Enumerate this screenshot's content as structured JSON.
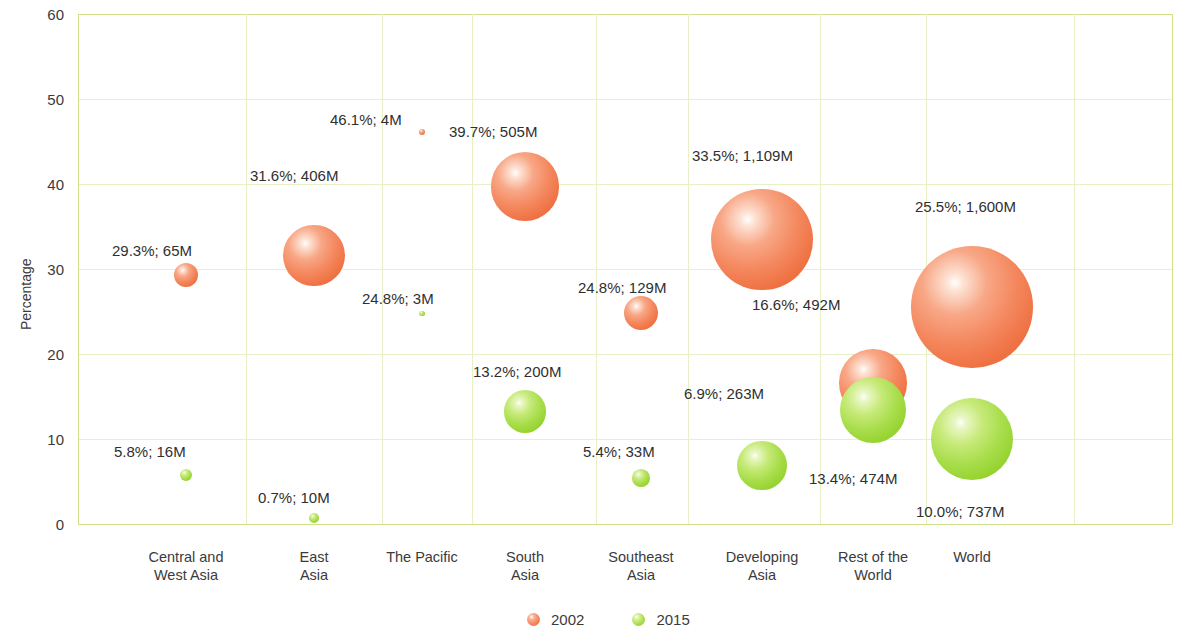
{
  "chart_data": {
    "type": "scatter",
    "title": "",
    "subtitle": "",
    "xlabel": "",
    "ylabel": "Percentage",
    "ylim": [
      0,
      60
    ],
    "y_ticks": [
      "0",
      "10",
      "20",
      "30",
      "40",
      "50",
      "60"
    ],
    "grid": true,
    "legend_position": "bottom",
    "bubble_size_units": "millions of people",
    "categories": [
      "Central and\nWest Asia",
      "East\nAsia",
      "The Pacific",
      "South\nAsia",
      "Southeast\nAsia",
      "Developing\nAsia",
      "Rest of the\nWorld",
      "World"
    ],
    "series": [
      {
        "name": "2002",
        "color": "#ef7243",
        "values": [
          29.3,
          31.6,
          46.1,
          39.7,
          24.8,
          33.5,
          16.6,
          25.5
        ],
        "sizes": [
          65,
          406,
          4,
          505,
          129,
          1109,
          492,
          1600
        ],
        "labels": [
          "29.3%; 65M",
          "31.6%; 406M",
          "46.1%; 4M",
          "39.7%; 505M",
          "24.8%; 129M",
          "33.5%; 1,109M",
          "16.6%; 492M",
          "25.5%; 1,600M"
        ]
      },
      {
        "name": "2015",
        "color": "#97d431",
        "values": [
          5.8,
          0.7,
          24.8,
          13.2,
          5.4,
          6.9,
          13.4,
          10.0
        ],
        "sizes": [
          16,
          10,
          3,
          200,
          33,
          263,
          474,
          737
        ],
        "labels": [
          "5.8%; 16M",
          "0.7%; 10M",
          "24.8%; 3M",
          "13.2%; 200M",
          "5.4%; 33M",
          "6.9%; 263M",
          "13.4%; 474M",
          "10.0%; 737M"
        ]
      }
    ]
  },
  "legend": {
    "items": [
      {
        "label": "2002",
        "swatch": "bubble-2002-swatch"
      },
      {
        "label": "2015",
        "swatch": "bubble-2015-swatch"
      }
    ]
  },
  "layout": {
    "plot": {
      "left": 78,
      "top": 14,
      "width": 1094,
      "height": 510
    },
    "y_axis_title_pos": {
      "left": 18,
      "top": 330
    },
    "legend_pos": {
      "left": 527,
      "top": 612
    },
    "x_label_top": 548,
    "category_centers": [
      186,
      314,
      422,
      525,
      641,
      762,
      873,
      972
    ],
    "grid_v_x": [
      78,
      246,
      382,
      472,
      596,
      688,
      820,
      926,
      1074,
      1172
    ],
    "bubble_scale": 1.52,
    "labels_2002": [
      {
        "x": 112,
        "y": 243,
        "anchor": "start"
      },
      {
        "x": 250,
        "y": 168,
        "anchor": "start"
      },
      {
        "x": 330,
        "y": 112,
        "anchor": "start"
      },
      {
        "x": 449,
        "y": 124,
        "anchor": "start"
      },
      {
        "x": 578,
        "y": 280,
        "anchor": "start"
      },
      {
        "x": 692,
        "y": 148,
        "anchor": "start"
      },
      {
        "x": 752,
        "y": 297,
        "anchor": "start"
      },
      {
        "x": 915,
        "y": 199,
        "anchor": "start"
      }
    ],
    "labels_2015": [
      {
        "x": 114,
        "y": 444,
        "anchor": "start"
      },
      {
        "x": 258,
        "y": 490,
        "anchor": "start"
      },
      {
        "x": 362,
        "y": 291,
        "anchor": "start"
      },
      {
        "x": 473,
        "y": 364,
        "anchor": "start"
      },
      {
        "x": 583,
        "y": 444,
        "anchor": "start"
      },
      {
        "x": 684,
        "y": 386,
        "anchor": "start"
      },
      {
        "x": 809,
        "y": 471,
        "anchor": "start"
      },
      {
        "x": 916,
        "y": 504,
        "anchor": "start"
      }
    ]
  }
}
